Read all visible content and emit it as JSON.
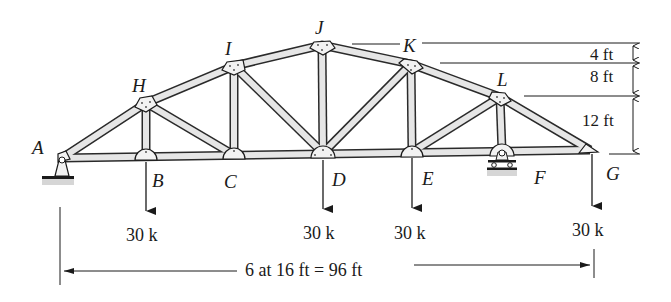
{
  "figure": {
    "type": "roof truss (bowstring-style) with vertical point loads",
    "joints": {
      "bottom_chord": [
        "A",
        "B",
        "C",
        "D",
        "E",
        "F",
        "G"
      ],
      "top_chord": [
        "H",
        "I",
        "J",
        "K",
        "L"
      ]
    },
    "joint_labels": {
      "A": "A",
      "B": "B",
      "C": "C",
      "D": "D",
      "E": "E",
      "F": "F",
      "G": "G",
      "H": "H",
      "I": "I",
      "J": "J",
      "K": "K",
      "L": "L"
    },
    "supports": {
      "A": "pin",
      "F": "roller"
    },
    "loads": [
      {
        "joint": "B",
        "label": "30 k"
      },
      {
        "joint": "D",
        "label": "30 k"
      },
      {
        "joint": "E",
        "label": "30 k"
      },
      {
        "joint": "G",
        "label": "30 k"
      }
    ],
    "dimensions": {
      "span": "6 at 16 ft = 96 ft",
      "heights": [
        "4 ft",
        "8 ft",
        "12 ft"
      ]
    },
    "colors": {
      "line": "#1a1a1a",
      "member_fill": "#e6e6e6",
      "plate_fill": "#f2f2f2"
    }
  }
}
